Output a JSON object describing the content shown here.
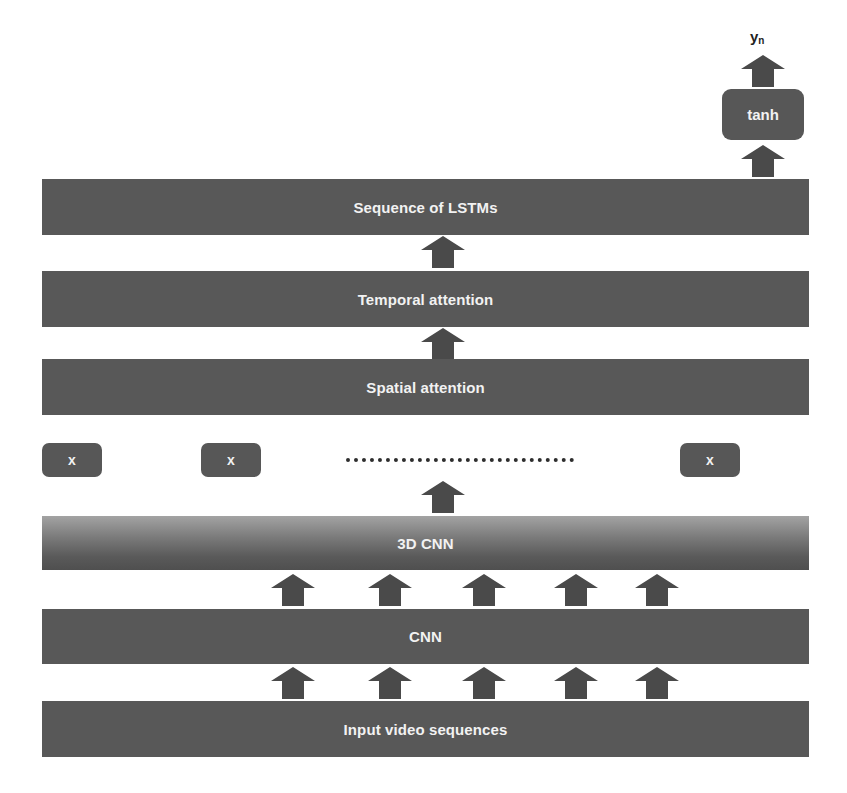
{
  "diagram": {
    "output": {
      "label": "y",
      "subscript": "n"
    },
    "activation": {
      "label": "tanh"
    },
    "layers": {
      "sequence_lstm": "Sequence of LSTMs",
      "temporal_attention": "Temporal attention",
      "spatial_attention": "Spatial attention",
      "cnn3d": "3D CNN",
      "cnn": "CNN",
      "input": "Input video sequences"
    },
    "multipliers": [
      {
        "label": "x"
      },
      {
        "label": "x"
      },
      {
        "label": "x"
      }
    ],
    "colors": {
      "block": "#585858",
      "arrow": "#4a4a4a",
      "text": "#f2f2f2",
      "background": "#ffffff"
    },
    "arrow_columns_count": 5
  }
}
